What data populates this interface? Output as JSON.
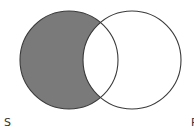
{
  "diagram": {
    "type": "venn",
    "sets": [
      {
        "name": "S",
        "shaded_region": "S minus P"
      },
      {
        "name": "P"
      }
    ],
    "labels": {
      "left": "S",
      "right": "P"
    },
    "colors": {
      "shade": "#7a7a7a",
      "stroke": "#3a3a3a",
      "background": "#ffffff"
    }
  }
}
